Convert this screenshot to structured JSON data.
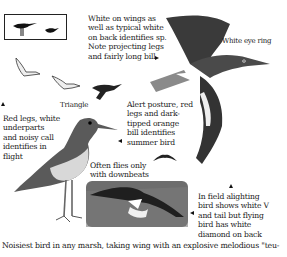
{
  "page": {
    "notes": {
      "wings": "White on wings as\nwell as typical white\non back identifies sp.\nNote projecting legs\nand fairly long bill",
      "eye_ring": "White eye ring",
      "triangle": "Triangle",
      "red_legs": "Red legs, white\nunderparts\nand noisy call\nidentifies in\nflight",
      "alert": "Alert posture, red\nlegs and dark-\ntipped orange\nbill identifies\nsummer bird",
      "downbeats": "Often flies only\nwith downbeats",
      "alighting": "In field alighting\nbird shows white V\nand tail but flying\nbird has white\ndiamond on back"
    },
    "caption": "Noisiest bird in any marsh, taking wing with an explosive melodious \"teu-"
  },
  "colors": {
    "ink": "#1a1a1a",
    "plumage_dark": "#3a3a3a",
    "plumage_mid": "#7a7a7a",
    "grass": "#6d6d6d",
    "background": "#ffffff"
  }
}
